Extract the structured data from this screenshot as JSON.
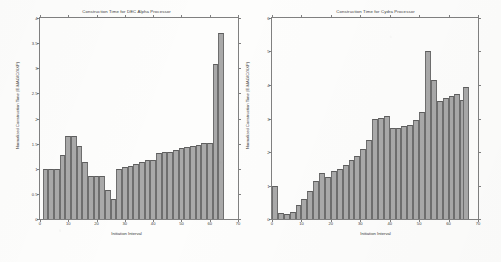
{
  "figure": {
    "background": "#fdfdfc",
    "bar_fill": "#a9a9a9",
    "bar_edge": "#6e6e6e",
    "axis_color": "#808080"
  },
  "chart_data": [
    {
      "type": "bar",
      "title": "Construction Time for DEC Alpha Processor",
      "xlabel": "Initiation Interval",
      "ylabel": "Normalized Construction Time (E-MAGIC/XXP)",
      "xlim": [
        0,
        70
      ],
      "ylim": [
        0,
        4
      ],
      "xticks": [
        0,
        10,
        20,
        30,
        40,
        50,
        60,
        70
      ],
      "yticks": [
        0,
        0.5,
        1,
        1.5,
        2,
        2.5,
        3,
        3.5,
        4
      ],
      "grid": false,
      "legend": null,
      "x": [
        2,
        4,
        6,
        8,
        10,
        12,
        14,
        16,
        18,
        20,
        22,
        24,
        26,
        28,
        30,
        32,
        34,
        36,
        38,
        40,
        42,
        44,
        46,
        48,
        50,
        52,
        54,
        56,
        58,
        60,
        62,
        64
      ],
      "values": [
        1.0,
        1.0,
        1.0,
        1.28,
        1.66,
        1.65,
        1.45,
        1.13,
        0.86,
        0.86,
        0.85,
        0.57,
        0.4,
        1.0,
        1.03,
        1.06,
        1.1,
        1.13,
        1.17,
        1.18,
        1.32,
        1.33,
        1.34,
        1.37,
        1.42,
        1.43,
        1.46,
        1.48,
        1.51,
        1.51,
        3.08,
        3.48,
        3.7
      ]
    },
    {
      "type": "bar",
      "title": "Construction Time for Cydra Processor",
      "xlabel": "Initiation Interval",
      "ylabel": "Normalized Construction Time (E-MAGIC/XXP)",
      "xlim": [
        0,
        70
      ],
      "ylim": [
        0,
        6
      ],
      "xticks": [
        0,
        10,
        20,
        30,
        40,
        50,
        60,
        70
      ],
      "yticks": [
        0,
        1,
        2,
        3,
        4,
        5,
        6
      ],
      "grid": false,
      "legend": null,
      "x": [
        1,
        3,
        5,
        7,
        9,
        11,
        13,
        15,
        17,
        19,
        21,
        23,
        25,
        27,
        29,
        31,
        33,
        35,
        37,
        39,
        41,
        43,
        45,
        47,
        49,
        51,
        53,
        55,
        57,
        59,
        61,
        63,
        65
      ],
      "values": [
        1.0,
        0.18,
        0.14,
        0.22,
        0.42,
        0.6,
        0.85,
        1.12,
        1.38,
        1.24,
        1.42,
        1.48,
        1.62,
        1.75,
        1.88,
        2.1,
        2.35,
        2.98,
        3.02,
        3.08,
        2.72,
        2.72,
        2.77,
        2.82,
        2.95,
        3.2,
        5.02,
        4.16,
        3.52,
        3.6,
        3.68,
        3.72,
        3.55,
        3.95
      ]
    }
  ]
}
